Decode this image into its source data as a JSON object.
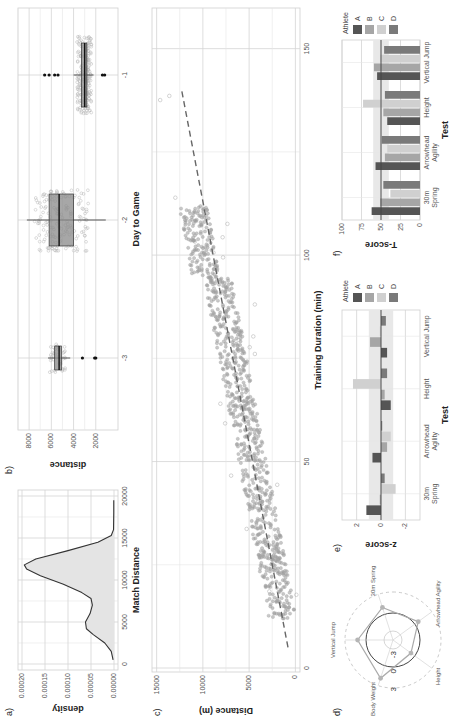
{
  "figure": {
    "panel_labels": [
      "a)",
      "b)",
      "c)",
      "d)",
      "e)",
      "f)"
    ]
  },
  "chart_data": [
    {
      "panel": "a)",
      "type": "area",
      "title": "",
      "xlabel": "Match Distance",
      "ylabel": "density",
      "xlim": [
        0,
        20000
      ],
      "ylim": [
        0,
        0.0002
      ],
      "x_ticks": [
        "0",
        "5000",
        "10000",
        "15000",
        "20000"
      ],
      "y_ticks": [
        "0.00000",
        "0.00005",
        "0.00010",
        "0.00015",
        "0.00020"
      ],
      "x": [
        500,
        1500,
        2500,
        3500,
        4200,
        5000,
        6000,
        7000,
        7800,
        8500,
        9500,
        10500,
        11300,
        11800,
        12500,
        13500,
        14500,
        15300,
        16000,
        18000,
        19500
      ],
      "values": [
        2e-06,
        6e-06,
        2e-05,
        4.5e-05,
        6e-05,
        6.2e-05,
        5.2e-05,
        4.7e-05,
        5e-05,
        7e-05,
        0.00011,
        0.00016,
        0.00019,
        0.000195,
        0.00017,
        0.0001,
        3.5e-05,
        6e-06,
        1e-06,
        5e-07,
        5e-07
      ],
      "grid": true
    },
    {
      "panel": "b)",
      "type": "box",
      "xlabel": "Day to Game",
      "ylabel": "distance",
      "categories": [
        "-3",
        "-2",
        "-1"
      ],
      "y_ticks": [
        "2000",
        "4000",
        "6000",
        "8000"
      ],
      "ylim": [
        0,
        9000
      ],
      "boxes": [
        {
          "day": "-3",
          "q1": 5100,
          "median": 5300,
          "q3": 5700,
          "whisker_low": 4300,
          "whisker_high": 6300,
          "outliers": [
            3200,
            2100,
            2000
          ]
        },
        {
          "day": "-2",
          "q1": 4000,
          "median": 5300,
          "q3": 6200,
          "whisker_low": 1100,
          "whisker_high": 8200,
          "outliers": []
        },
        {
          "day": "-1",
          "q1": 2800,
          "median": 3000,
          "q3": 3300,
          "whisker_low": 2200,
          "whisker_high": 4000,
          "outliers": [
            6600,
            6200,
            5700,
            5400,
            1400,
            1200
          ]
        }
      ],
      "grid": true
    },
    {
      "panel": "c)",
      "type": "scatter",
      "xlabel": "Training Duration (min)",
      "ylabel": "Distance (m)",
      "xlim": [
        0,
        155
      ],
      "ylim": [
        -500,
        15500
      ],
      "x_ticks": [
        "0",
        "50",
        "100",
        "150"
      ],
      "y_ticks": [
        "0",
        "5000",
        "10000",
        "15000"
      ],
      "trend_line": {
        "x": [
          5,
          140
        ],
        "y": [
          800,
          12300
        ],
        "style": "dashed"
      },
      "grid": true
    },
    {
      "panel": "d)",
      "type": "radar",
      "axes": [
        "30m Spring",
        "Arrowhead Agility",
        "Height",
        "Body Weight",
        "Vertical Jump"
      ],
      "ring_labels": [
        "-3",
        "0",
        "3"
      ],
      "values": [
        1.2,
        0.7,
        -0.8,
        2.2,
        1.4
      ]
    },
    {
      "panel": "e)",
      "type": "bar",
      "xlabel": "Test",
      "ylabel": "z-score",
      "categories": [
        "30m Spring",
        "Arrowhead Agility",
        "Height",
        "Vertical Jump"
      ],
      "category_lines": [
        [
          "30m",
          "Spring"
        ],
        [
          "Arrowhead",
          "Agility"
        ],
        [
          "Height"
        ],
        [
          "Vertical Jump"
        ]
      ],
      "ylim": [
        -3.2,
        3.2
      ],
      "y_ticks": [
        "-2",
        "0",
        "2"
      ],
      "band": [
        -1,
        1
      ],
      "legend_title": "Athlete",
      "series": [
        {
          "name": "A",
          "color": "#555555",
          "values": [
            1.2,
            0.7,
            -0.8,
            -0.5
          ]
        },
        {
          "name": "B",
          "color": "#a6a6a6",
          "values": [
            0.1,
            -0.5,
            -0.3,
            0.9
          ]
        },
        {
          "name": "C",
          "color": "#d0d0d0",
          "values": [
            -1.2,
            -0.8,
            2.3,
            0.1
          ]
        },
        {
          "name": "D",
          "color": "#7a7a7a",
          "values": [
            -0.3,
            -0.1,
            -0.5,
            -0.4
          ]
        }
      ],
      "grid": true
    },
    {
      "panel": "f)",
      "type": "bar",
      "xlabel": "Test",
      "ylabel": "T-score",
      "categories": [
        "30m Spring",
        "Arrowhead Agility",
        "Height",
        "Vertical Jump"
      ],
      "category_lines": [
        [
          "30m",
          "Spring"
        ],
        [
          "Arrowhead",
          "Agility"
        ],
        [
          "Height"
        ],
        [
          "Vertical Jump"
        ]
      ],
      "ylim": [
        0,
        100
      ],
      "y_ticks": [
        "0",
        "25",
        "50",
        "75",
        "100"
      ],
      "band": [
        40,
        60
      ],
      "legend_title": "Athlete",
      "series": [
        {
          "name": "A",
          "color": "#555555",
          "values": [
            62,
            57,
            42,
            55
          ]
        },
        {
          "name": "B",
          "color": "#a6a6a6",
          "values": [
            51,
            45,
            47,
            59
          ]
        },
        {
          "name": "C",
          "color": "#d0d0d0",
          "values": [
            38,
            42,
            73,
            51
          ]
        },
        {
          "name": "D",
          "color": "#7a7a7a",
          "values": [
            47,
            49,
            45,
            46
          ]
        }
      ],
      "grid": true
    }
  ]
}
